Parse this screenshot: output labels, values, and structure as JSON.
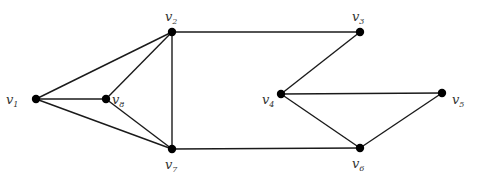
{
  "diagram": {
    "type": "undirected-graph",
    "node_color": "#000000",
    "edge_color": "#1a1a1a",
    "nodes": [
      {
        "id": "v1",
        "letter": "v",
        "sub": "1",
        "x": 36,
        "y": 99,
        "lx": 6,
        "ly": 104
      },
      {
        "id": "v2",
        "letter": "v",
        "sub": "2",
        "x": 172,
        "y": 32,
        "lx": 165,
        "ly": 21
      },
      {
        "id": "v3",
        "letter": "v",
        "sub": "3",
        "x": 360,
        "y": 32,
        "lx": 352,
        "ly": 21
      },
      {
        "id": "v4",
        "letter": "v",
        "sub": "4",
        "x": 281,
        "y": 94,
        "lx": 262,
        "ly": 104
      },
      {
        "id": "v5",
        "letter": "v",
        "sub": "5",
        "x": 442,
        "y": 93,
        "lx": 452,
        "ly": 104
      },
      {
        "id": "v6",
        "letter": "v",
        "sub": "6",
        "x": 360,
        "y": 148,
        "lx": 352,
        "ly": 168
      },
      {
        "id": "v7",
        "letter": "v",
        "sub": "7",
        "x": 172,
        "y": 149,
        "lx": 165,
        "ly": 169
      },
      {
        "id": "v8",
        "letter": "v",
        "sub": "8",
        "x": 106,
        "y": 99,
        "lx": 112,
        "ly": 104
      }
    ],
    "edges": [
      [
        "v1",
        "v2"
      ],
      [
        "v1",
        "v8"
      ],
      [
        "v1",
        "v7"
      ],
      [
        "v8",
        "v2"
      ],
      [
        "v8",
        "v7"
      ],
      [
        "v2",
        "v7"
      ],
      [
        "v2",
        "v3"
      ],
      [
        "v7",
        "v6"
      ],
      [
        "v3",
        "v4"
      ],
      [
        "v4",
        "v5"
      ],
      [
        "v4",
        "v6"
      ],
      [
        "v5",
        "v6"
      ]
    ]
  }
}
